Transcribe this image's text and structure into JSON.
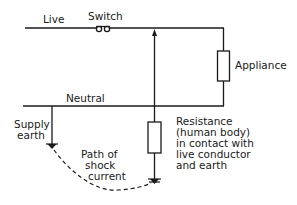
{
  "diagram": {
    "type": "electrical circuit schematic",
    "labels": {
      "live": "Live",
      "switch": "Switch",
      "appliance": "Appliance",
      "neutral": "Neutral",
      "supply_earth_line1": "Supply",
      "supply_earth_line2": "earth",
      "path_line1": "Path of",
      "path_line2": "shock",
      "path_line3": "current",
      "resistance_line1": "Resistance",
      "resistance_line2": "(human body)",
      "resistance_line3": "in contact with",
      "resistance_line4": "live conductor",
      "resistance_line5": "and earth"
    },
    "colors": {
      "line": "#1a1a1a",
      "background": "#ffffff"
    }
  }
}
